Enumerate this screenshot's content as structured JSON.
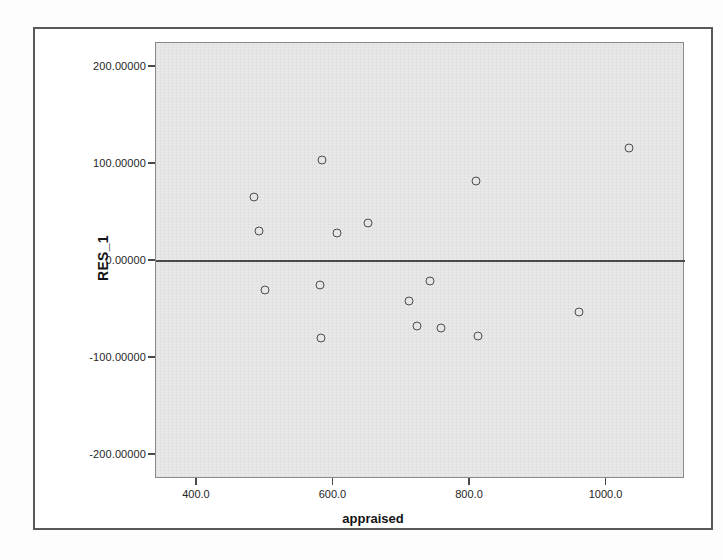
{
  "chart_data": {
    "type": "scatter",
    "title": "",
    "xlabel": "appraised",
    "ylabel": "RES_1",
    "xlim": [
      340,
      1115
    ],
    "ylim": [
      -225,
      225
    ],
    "grid": false,
    "legend": "none",
    "zero_reference_line": 0,
    "xticks": [
      400,
      600,
      800,
      1000
    ],
    "xtick_labels": [
      "400.0",
      "600.0",
      "800.0",
      "1000.0"
    ],
    "yticks": [
      200,
      100,
      0,
      -100,
      -200
    ],
    "ytick_labels": [
      "200.00000",
      "100.00000",
      "0.00000",
      "-100.00000",
      "-200.00000"
    ],
    "x": [
      483,
      491,
      583,
      605,
      650,
      809,
      1033,
      500,
      580,
      582,
      710,
      723,
      742,
      757,
      812,
      960
    ],
    "y": [
      66,
      31,
      104,
      29,
      39,
      83,
      117,
      -30,
      -25,
      -79,
      -41,
      -67,
      -21,
      -69,
      -77,
      -53
    ],
    "points": [
      {
        "x": 483,
        "y": 66
      },
      {
        "x": 491,
        "y": 31
      },
      {
        "x": 583,
        "y": 104
      },
      {
        "x": 605,
        "y": 29
      },
      {
        "x": 650,
        "y": 39
      },
      {
        "x": 809,
        "y": 83
      },
      {
        "x": 1033,
        "y": 117
      },
      {
        "x": 500,
        "y": -30
      },
      {
        "x": 580,
        "y": -25
      },
      {
        "x": 582,
        "y": -79
      },
      {
        "x": 710,
        "y": -41
      },
      {
        "x": 723,
        "y": -67
      },
      {
        "x": 742,
        "y": -21
      },
      {
        "x": 757,
        "y": -69
      },
      {
        "x": 812,
        "y": -77
      },
      {
        "x": 960,
        "y": -53
      }
    ],
    "marker_style": "open-circle",
    "marker_color": "#4d4d4d",
    "panel_color": "#e8e8e8",
    "axis_color": "#4a4a4a"
  }
}
